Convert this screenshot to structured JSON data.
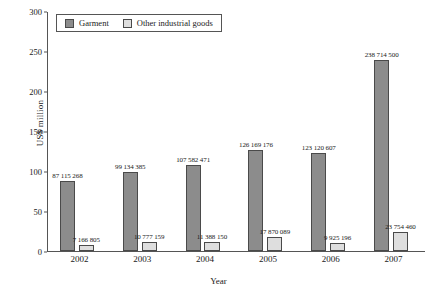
{
  "chart_data": {
    "type": "bar",
    "title": "",
    "xlabel": "Year",
    "ylabel": "US$ million",
    "categories": [
      "2002",
      "2003",
      "2004",
      "2005",
      "2006",
      "2007"
    ],
    "ylim": [
      0,
      300
    ],
    "yticks": [
      0,
      50,
      100,
      150,
      200,
      250,
      300
    ],
    "ytick_labels": [
      "0",
      "50",
      "100",
      "150",
      "200",
      "250",
      "300"
    ],
    "grid": false,
    "legend_position": "top-left",
    "series": [
      {
        "name": "Garment",
        "color": "#8c8c8c",
        "values": [
          87.115268,
          99.134385,
          107.582471,
          126.169176,
          123.120607,
          238.7145
        ],
        "labels": [
          "87 115 268",
          "99 134 385",
          "107 582 471",
          "126 169 176",
          "123 120 607",
          "238 714 500"
        ]
      },
      {
        "name": "Other industrial goods",
        "color": "#dedede",
        "values": [
          7.166805,
          10.777159,
          11.38815,
          17.870089,
          9.925196,
          23.75446
        ],
        "labels": [
          "7 166 805",
          "10 777 159",
          "11 388 150",
          "17 870 089",
          "9 925 196",
          "23 754 460"
        ]
      }
    ]
  }
}
